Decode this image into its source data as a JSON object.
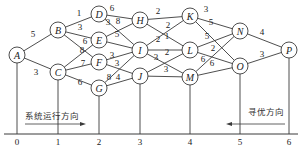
{
  "nodes": [
    {
      "id": "A",
      "x": 17,
      "y": 55
    },
    {
      "id": "B",
      "x": 58,
      "y": 30
    },
    {
      "id": "C",
      "x": 58,
      "y": 72
    },
    {
      "id": "D",
      "x": 99,
      "y": 14
    },
    {
      "id": "E",
      "x": 99,
      "y": 40
    },
    {
      "id": "F",
      "x": 99,
      "y": 62
    },
    {
      "id": "G",
      "x": 99,
      "y": 88
    },
    {
      "id": "H",
      "x": 140,
      "y": 20
    },
    {
      "id": "I",
      "x": 140,
      "y": 50
    },
    {
      "id": "J",
      "x": 140,
      "y": 76
    },
    {
      "id": "K",
      "x": 190,
      "y": 16
    },
    {
      "id": "L",
      "x": 190,
      "y": 50
    },
    {
      "id": "M",
      "x": 190,
      "y": 77
    },
    {
      "id": "N",
      "x": 240,
      "y": 31
    },
    {
      "id": "O",
      "x": 240,
      "y": 66
    },
    {
      "id": "P",
      "x": 289,
      "y": 50
    }
  ],
  "edges": [
    {
      "from": "A",
      "to": "B",
      "w": "5",
      "lx": 33,
      "ly": 37
    },
    {
      "from": "A",
      "to": "C",
      "w": "3",
      "lx": 36,
      "ly": 75
    },
    {
      "from": "B",
      "to": "D",
      "w": "1",
      "lx": 79,
      "ly": 16
    },
    {
      "from": "B",
      "to": "E",
      "w": "3",
      "lx": 80,
      "ly": 30
    },
    {
      "from": "B",
      "to": "F",
      "w": "6",
      "lx": 85,
      "ly": 44
    },
    {
      "from": "C",
      "to": "E",
      "w": "8",
      "lx": 82,
      "ly": 53
    },
    {
      "from": "C",
      "to": "F",
      "w": "7",
      "lx": 83,
      "ly": 66
    },
    {
      "from": "C",
      "to": "G",
      "w": "6",
      "lx": 80,
      "ly": 85
    },
    {
      "from": "D",
      "to": "H",
      "w": "6",
      "lx": 112,
      "ly": 11
    },
    {
      "from": "D",
      "to": "I",
      "w": "3",
      "lx": 108,
      "ly": 25
    },
    {
      "from": "E",
      "to": "H",
      "w": "8",
      "lx": 118,
      "ly": 24
    },
    {
      "from": "E",
      "to": "I",
      "w": "5",
      "lx": 117,
      "ly": 37
    },
    {
      "from": "F",
      "to": "I",
      "w": "3",
      "lx": 112,
      "ly": 58
    },
    {
      "from": "F",
      "to": "J",
      "w": "3",
      "lx": 117,
      "ly": 66
    },
    {
      "from": "G",
      "to": "I",
      "w": "8",
      "lx": 109,
      "ly": 80
    },
    {
      "from": "G",
      "to": "J",
      "w": "4",
      "lx": 118,
      "ly": 80
    },
    {
      "from": "H",
      "to": "K",
      "w": "2",
      "lx": 158,
      "ly": 14
    },
    {
      "from": "H",
      "to": "L",
      "w": "2",
      "lx": 168,
      "ly": 28
    },
    {
      "from": "I",
      "to": "K",
      "w": "1",
      "lx": 167,
      "ly": 39
    },
    {
      "from": "I",
      "to": "L",
      "w": "2",
      "lx": 158,
      "ly": 42
    },
    {
      "from": "I",
      "to": "M",
      "w": "3",
      "lx": 156,
      "ly": 60
    },
    {
      "from": "J",
      "to": "L",
      "w": "2",
      "lx": 167,
      "ly": 55
    },
    {
      "from": "J",
      "to": "M",
      "w": "3",
      "lx": 166,
      "ly": 72
    },
    {
      "from": "K",
      "to": "N",
      "w": "3",
      "lx": 206,
      "ly": 12
    },
    {
      "from": "K",
      "to": "O",
      "w": "5",
      "lx": 211,
      "ly": 25
    },
    {
      "from": "L",
      "to": "N",
      "w": "5",
      "lx": 207,
      "ly": 39
    },
    {
      "from": "L",
      "to": "O",
      "w": "2",
      "lx": 213,
      "ly": 51
    },
    {
      "from": "M",
      "to": "N",
      "w": "6",
      "lx": 203,
      "ly": 62
    },
    {
      "from": "M",
      "to": "O",
      "w": "6",
      "lx": 212,
      "ly": 66
    },
    {
      "from": "N",
      "to": "P",
      "w": "4",
      "lx": 262,
      "ly": 35
    },
    {
      "from": "O",
      "to": "P",
      "w": "3",
      "lx": 262,
      "ly": 57
    }
  ],
  "axis": {
    "y": 134,
    "ticks": [
      {
        "label": "0",
        "x": 17
      },
      {
        "label": "1",
        "x": 58
      },
      {
        "label": "2",
        "x": 99
      },
      {
        "label": "3",
        "x": 140
      },
      {
        "label": "4",
        "x": 190
      },
      {
        "label": "5",
        "x": 240
      },
      {
        "label": "6",
        "x": 289
      }
    ]
  },
  "annotations": {
    "system_direction": "系统运行方向",
    "search_direction": "寻优方向"
  }
}
